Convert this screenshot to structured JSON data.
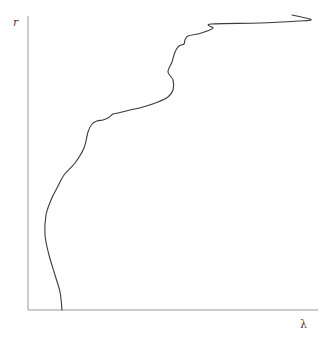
{
  "chart_data": {
    "type": "line",
    "title": "",
    "xlabel": "λ",
    "ylabel": "r",
    "grid": false,
    "legend": null,
    "ticks": {
      "x": [],
      "y": []
    },
    "axes_pixels": {
      "origin": [
        28,
        310
      ],
      "x_end": 318,
      "y_top": 16
    },
    "series": [
      {
        "name": "r(λ)",
        "points_px": [
          [
            62,
            310
          ],
          [
            60,
            292
          ],
          [
            55,
            275
          ],
          [
            49,
            255
          ],
          [
            45,
            235
          ],
          [
            46,
            215
          ],
          [
            51,
            200
          ],
          [
            57,
            188
          ],
          [
            64,
            175
          ],
          [
            75,
            163
          ],
          [
            84,
            148
          ],
          [
            88,
            132
          ],
          [
            92,
            124
          ],
          [
            97,
            121
          ],
          [
            103,
            120
          ],
          [
            108,
            118
          ],
          [
            113,
            114
          ],
          [
            118,
            113
          ],
          [
            130,
            110
          ],
          [
            143,
            107
          ],
          [
            158,
            102
          ],
          [
            168,
            97
          ],
          [
            173,
            90
          ],
          [
            173,
            80
          ],
          [
            168,
            72
          ],
          [
            172,
            62
          ],
          [
            174,
            55
          ],
          [
            176,
            50
          ],
          [
            179,
            46
          ],
          [
            184,
            44
          ],
          [
            185,
            40
          ],
          [
            188,
            36
          ],
          [
            198,
            34
          ],
          [
            207,
            31
          ],
          [
            213,
            28
          ],
          [
            211,
            24
          ],
          [
            260,
            23
          ],
          [
            300,
            21
          ],
          [
            311,
            20
          ],
          [
            306,
            18
          ],
          [
            292,
            15
          ]
        ]
      }
    ]
  }
}
